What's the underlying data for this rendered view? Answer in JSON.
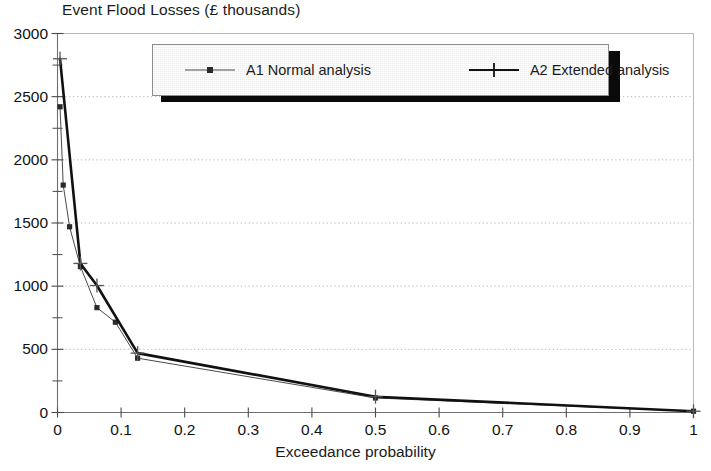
{
  "chart_data": {
    "type": "line",
    "title": "Event Flood Losses (£ thousands)",
    "xlabel": "Exceedance probability",
    "ylabel": "",
    "xlim": [
      0,
      1
    ],
    "ylim": [
      0,
      3000
    ],
    "grid": true,
    "grid_axis": "y",
    "legend_position": "top-center-inside",
    "x_ticks": [
      "0",
      "0.1",
      "0.2",
      "0.3",
      "0.4",
      "0.5",
      "0.6",
      "0.7",
      "0.8",
      "0.9",
      "1"
    ],
    "x_tick_values": [
      0,
      0.1,
      0.2,
      0.3,
      0.4,
      0.5,
      0.6,
      0.7,
      0.8,
      0.9,
      1
    ],
    "y_ticks": [
      "0",
      "500",
      "1000",
      "1500",
      "2000",
      "2500",
      "3000"
    ],
    "y_tick_values": [
      0,
      500,
      1000,
      1500,
      2000,
      2500,
      3000
    ],
    "y_minor_tick_values": [
      250,
      750,
      1250,
      1750,
      2250,
      2750
    ],
    "series": [
      {
        "name": "A1 Normal analysis",
        "marker": "square",
        "color": "#4a4a4a",
        "line_width": 1,
        "points": [
          {
            "x": 0.004,
            "y": 2420
          },
          {
            "x": 0.009,
            "y": 1800
          },
          {
            "x": 0.019,
            "y": 1470
          },
          {
            "x": 0.036,
            "y": 1155
          },
          {
            "x": 0.062,
            "y": 830
          },
          {
            "x": 0.091,
            "y": 715
          },
          {
            "x": 0.126,
            "y": 430
          },
          {
            "x": 0.5,
            "y": 115
          },
          {
            "x": 1.0,
            "y": 10
          }
        ]
      },
      {
        "name": "A2 Extended analysis",
        "marker": "plus",
        "color": "#111111",
        "line_width": 2.6,
        "points": [
          {
            "x": 0.004,
            "y": 2800
          },
          {
            "x": 0.036,
            "y": 1180
          },
          {
            "x": 0.062,
            "y": 1005
          },
          {
            "x": 0.126,
            "y": 470
          },
          {
            "x": 0.5,
            "y": 125
          },
          {
            "x": 1.0,
            "y": 10
          }
        ]
      }
    ]
  },
  "legend": {
    "entries": [
      {
        "label": "A1 Normal analysis"
      },
      {
        "label": "A2 Extended analysis"
      }
    ]
  }
}
